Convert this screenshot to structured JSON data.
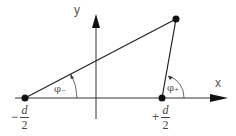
{
  "diagram": {
    "axes": {
      "x_label": "x",
      "y_label": "y"
    },
    "points": {
      "left": {
        "sign": "−",
        "numerator": "d",
        "denominator": "2"
      },
      "right": {
        "sign": "+",
        "numerator": "d",
        "denominator": "2"
      },
      "apex": {
        "label": ""
      }
    },
    "angles": {
      "minus": "φ₋",
      "plus": "φ₊"
    },
    "colors": {
      "stroke": "#222222",
      "label": "#555555"
    }
  }
}
